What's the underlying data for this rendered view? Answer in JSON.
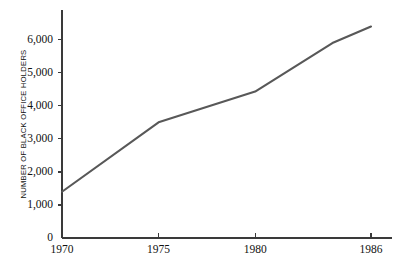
{
  "chart_data": {
    "type": "line",
    "title": "",
    "subtitle": "",
    "xlabel": "",
    "ylabel": "NUMBER OF BLACK OFFICE HOLDERS",
    "x": [
      1970,
      1975,
      1980,
      1984,
      1986
    ],
    "values": [
      1400,
      3500,
      4430,
      5900,
      6400
    ],
    "series": [
      {
        "name": "Number of black office holders",
        "x": [
          1970,
          1975,
          1980,
          1984,
          1986
        ],
        "values": [
          1400,
          3500,
          4430,
          5900,
          6400
        ]
      }
    ],
    "xlim": [
      1970,
      1986
    ],
    "ylim": [
      0,
      6900
    ],
    "xticks": [
      1970,
      1975,
      1980,
      1986
    ],
    "xtick_labels": [
      "1970",
      "1975",
      "1980",
      "1986"
    ],
    "yticks": [
      0,
      1000,
      2000,
      3000,
      4000,
      5000,
      6000
    ],
    "ytick_labels": [
      "0",
      "1,000",
      "2,000",
      "3,000",
      "4,000",
      "5,000",
      "6,000"
    ],
    "grid": false,
    "legend": false,
    "legend_position": "none",
    "line_color": "#585858",
    "axis_color": "#3a3a3a",
    "background_color": "#ffffff",
    "text_color": "#111111"
  }
}
